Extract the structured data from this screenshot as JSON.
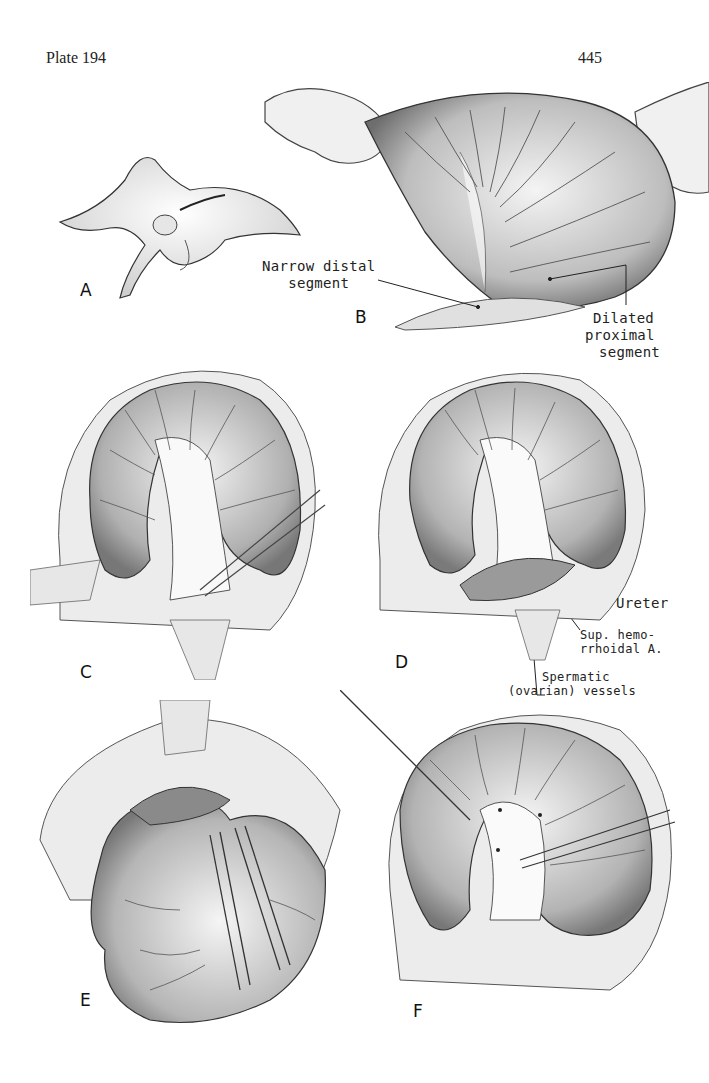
{
  "page": {
    "plate_label": "Plate 194",
    "page_number": "445"
  },
  "panels": [
    {
      "id": "A",
      "letter": "A",
      "subject": "infant-lithotomy-position"
    },
    {
      "id": "B",
      "letter": "B",
      "subject": "colon-held-exposed"
    },
    {
      "id": "C",
      "letter": "C",
      "subject": "mesentery-dissection"
    },
    {
      "id": "D",
      "letter": "D",
      "subject": "retroperitoneal-structures"
    },
    {
      "id": "E",
      "letter": "E",
      "subject": "colon-retracted-clamps"
    },
    {
      "id": "F",
      "letter": "F",
      "subject": "vessel-ligation"
    }
  ],
  "callouts": {
    "narrow_distal": {
      "line1": "Narrow distal",
      "line2": "segment"
    },
    "dilated_proximal": {
      "line1": "Dilated",
      "line2": "proximal",
      "line3": "segment"
    },
    "ureter": "Ureter",
    "sup_hemorrhoidal": {
      "line1": "Sup. hemo-",
      "line2": "rrhoidal A."
    },
    "spermatic": {
      "line1": "Spermatic",
      "line2": "(ovarian) vessels"
    }
  },
  "colors": {
    "ink": "#1a1a1a",
    "shade_dark": "#6e6e6e",
    "shade_mid": "#a8a8a8",
    "shade_light": "#d9d9d9",
    "paper": "#ffffff"
  }
}
